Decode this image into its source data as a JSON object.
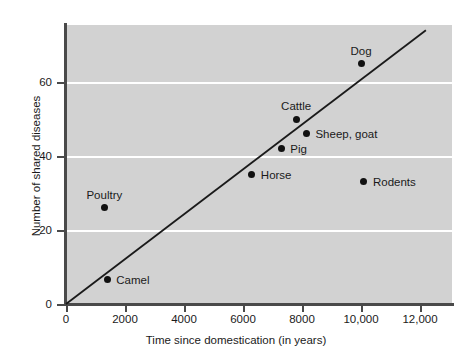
{
  "chart_data": {
    "type": "scatter",
    "title": "",
    "xlabel": "Time since domestication (in years)",
    "ylabel": "Number of shared diseases",
    "xlim": [
      0,
      13100
    ],
    "ylim": [
      0,
      75
    ],
    "grid": "horizontal",
    "legend": "none",
    "xticks": [
      {
        "value": 0,
        "label": "0"
      },
      {
        "value": 2000,
        "label": "2000"
      },
      {
        "value": 4000,
        "label": "4000"
      },
      {
        "value": 6000,
        "label": "6000"
      },
      {
        "value": 8000,
        "label": "8000"
      },
      {
        "value": 10000,
        "label": "10,000"
      },
      {
        "value": 12000,
        "label": "12,000"
      }
    ],
    "yticks": [
      {
        "value": 0,
        "label": "0"
      },
      {
        "value": 20,
        "label": "20"
      },
      {
        "value": 40,
        "label": "40"
      },
      {
        "value": 60,
        "label": "60"
      }
    ],
    "points": [
      {
        "name": "Camel",
        "x": 1400,
        "y": 6.5,
        "label": "Camel",
        "label_pos": "right"
      },
      {
        "name": "Poultry",
        "x": 1300,
        "y": 26,
        "label": "Poultry",
        "label_pos": "above"
      },
      {
        "name": "Horse",
        "x": 6300,
        "y": 35,
        "label": "Horse",
        "label_pos": "right"
      },
      {
        "name": "Pig",
        "x": 7300,
        "y": 42,
        "label": "Pig",
        "label_pos": "right"
      },
      {
        "name": "Cattle",
        "x": 7800,
        "y": 50,
        "label": "Cattle",
        "label_pos": "above"
      },
      {
        "name": "Sheep, goat",
        "x": 8150,
        "y": 46,
        "label": "Sheep, goat",
        "label_pos": "right"
      },
      {
        "name": "Rodents",
        "x": 10100,
        "y": 33,
        "label": "Rodents",
        "label_pos": "right"
      },
      {
        "name": "Dog",
        "x": 10000,
        "y": 65,
        "label": "Dog",
        "label_pos": "above"
      }
    ],
    "trendline": {
      "x_start": 0,
      "y_start": 0,
      "x_end": 12200,
      "y_end": 74
    },
    "colors": {
      "plot_background": "#d2d2d2",
      "gridline": "#ffffff",
      "axis": "#4a4a4a",
      "marker": "#111111",
      "trendline": "#1a1a1a",
      "text": "#1a1a1a",
      "page_background": "#ffffff"
    }
  }
}
